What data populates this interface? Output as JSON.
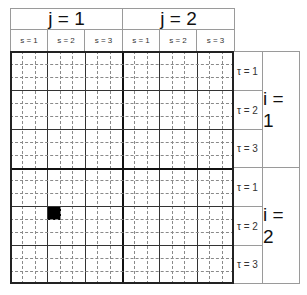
{
  "header": {
    "j_labels": [
      "j = 1",
      "j = 2"
    ],
    "s_labels": [
      "s = 1",
      "s = 2",
      "s = 3",
      "s = 1",
      "s = 2",
      "s = 3"
    ]
  },
  "rows": {
    "tau_labels": [
      "τ = 1",
      "τ = 2",
      "τ = 3",
      "τ = 1",
      "τ = 2",
      "τ = 3"
    ],
    "i_labels": [
      "i = 1",
      "i = 2"
    ]
  },
  "grid": {
    "j_blocks": 2,
    "s_per_j": 3,
    "sub_cols_per_s": 3,
    "i_blocks": 2,
    "tau_per_i": 3,
    "sub_rows_per_tau": 3,
    "filled_cells": [
      {
        "i": 2,
        "tau": 2,
        "sub_row": 1,
        "j": 1,
        "s": 2,
        "sub_col": 1,
        "color": "#000000"
      }
    ]
  }
}
